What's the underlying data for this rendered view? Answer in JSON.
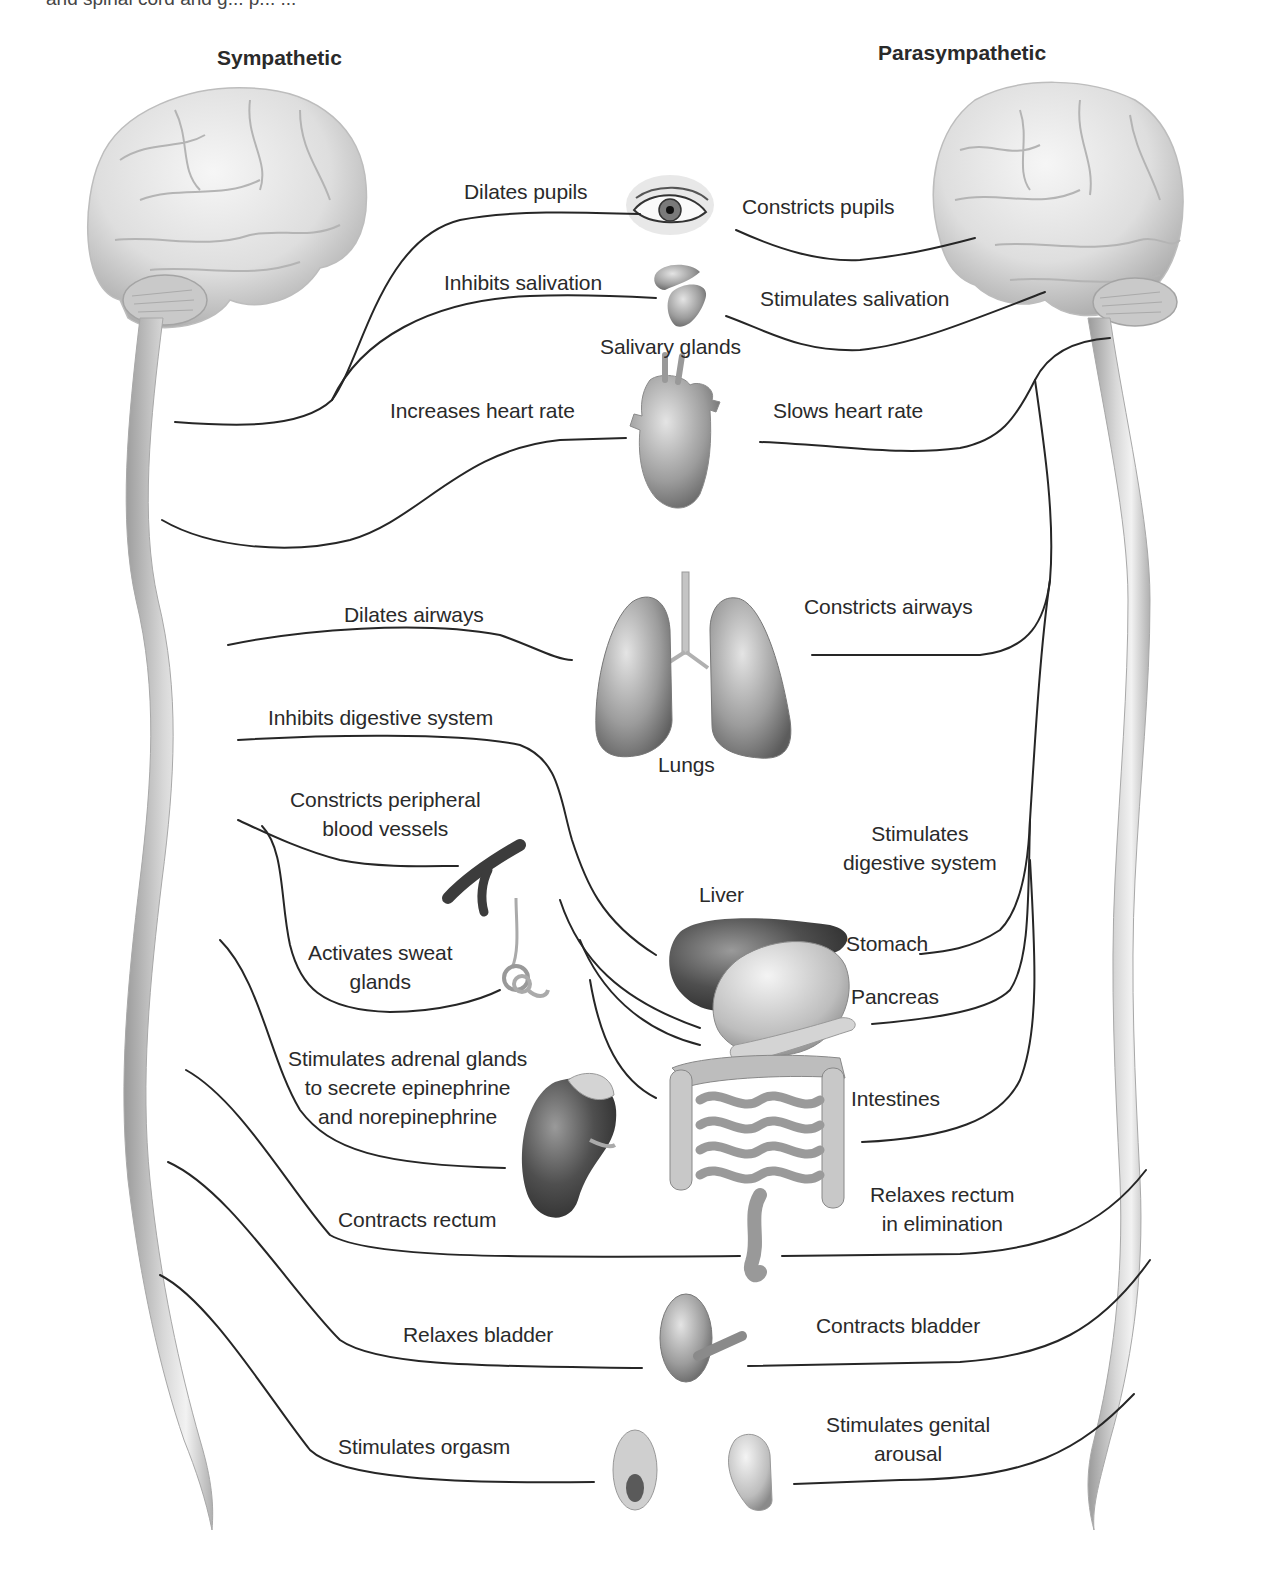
{
  "caption_fragment": "and spinal cord and g... p... ...",
  "headers": {
    "sympathetic": "Sympathetic",
    "parasympathetic": "Parasympathetic"
  },
  "organs": {
    "eye": "eye",
    "salivary_glands": "Salivary glands",
    "heart": "heart",
    "lungs": "Lungs",
    "blood_vessels": "blood vessels",
    "sweat_gland": "sweat gland",
    "liver": "Liver",
    "stomach": "Stomach",
    "pancreas": "Pancreas",
    "intestines": "Intestines",
    "adrenal_kidney": "adrenal gland / kidney",
    "bladder": "bladder",
    "genitals": "genitals"
  },
  "sympathetic_effects": [
    {
      "id": "pupils",
      "text": "Dilates pupils"
    },
    {
      "id": "salivation",
      "text": "Inhibits salivation"
    },
    {
      "id": "heart",
      "text": "Increases heart rate"
    },
    {
      "id": "airways",
      "text": "Dilates airways"
    },
    {
      "id": "digestive",
      "text": "Inhibits digestive system"
    },
    {
      "id": "vessels",
      "lines": [
        "Constricts peripheral",
        "blood vessels"
      ]
    },
    {
      "id": "sweat",
      "lines": [
        "Activates sweat",
        "glands"
      ]
    },
    {
      "id": "adrenal",
      "lines": [
        "Stimulates adrenal glands",
        "to secrete epinephrine",
        "and norepinephrine"
      ]
    },
    {
      "id": "rectum",
      "text": "Contracts rectum"
    },
    {
      "id": "bladder",
      "text": "Relaxes bladder"
    },
    {
      "id": "orgasm",
      "text": "Stimulates orgasm"
    }
  ],
  "parasympathetic_effects": [
    {
      "id": "pupils",
      "text": "Constricts pupils"
    },
    {
      "id": "salivation",
      "text": "Stimulates salivation"
    },
    {
      "id": "heart",
      "text": "Slows heart rate"
    },
    {
      "id": "airways",
      "text": "Constricts airways"
    },
    {
      "id": "digestive",
      "lines": [
        "Stimulates",
        "digestive system"
      ]
    },
    {
      "id": "rectum",
      "lines": [
        "Relaxes rectum",
        "in elimination"
      ]
    },
    {
      "id": "bladder",
      "text": "Contracts bladder"
    },
    {
      "id": "genital",
      "lines": [
        "Stimulates genital",
        "arousal"
      ]
    }
  ],
  "colors": {
    "background": "#ffffff",
    "nerve_line": "#262626",
    "brain_light": "#eeeeee",
    "brain_shadow": "#b5b5b5",
    "cord_light": "#e6e6e6",
    "cord_dark": "#9c9c9c",
    "organ_dark": "#4a4a4a",
    "organ_mid": "#8c8c8c"
  }
}
